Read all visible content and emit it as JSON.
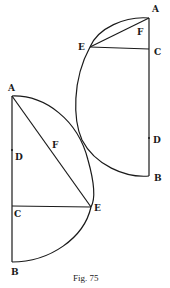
{
  "figure": {
    "caption": "Fig. 75",
    "right_diagram": {
      "labels": {
        "A": "A",
        "F": "F",
        "E": "E",
        "C": "C",
        "D": "D",
        "B": "B"
      }
    },
    "left_diagram": {
      "labels": {
        "A": "A",
        "F": "F",
        "D": "D",
        "C": "C",
        "E": "E",
        "B": "B"
      }
    },
    "colors": {
      "ink": "#1a1a1a",
      "background": "#ffffff"
    }
  }
}
